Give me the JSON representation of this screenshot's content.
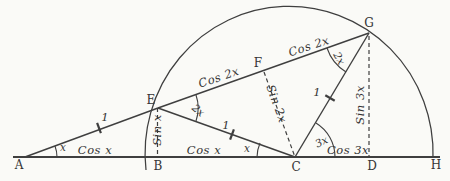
{
  "colors": {
    "ink": "#3f3f3f",
    "paper": "#fafaf7"
  },
  "points": {
    "A": "A",
    "B": "B",
    "C": "C",
    "D": "D",
    "E": "E",
    "F": "F",
    "G": "G",
    "H": "H"
  },
  "base_labels": {
    "ab": "Cos x",
    "bc": "Cos x",
    "cd": "Cos 3x"
  },
  "hyp_labels": {
    "ef": "Cos 2x",
    "fg": "Cos 2x"
  },
  "vert_labels": {
    "eb": "Sin x",
    "fc": "Sin 2x",
    "gd": "Sin 3x"
  },
  "unit_labels": {
    "ae": "1",
    "ec": "1",
    "cg": "1"
  },
  "angle_labels": {
    "a": "x",
    "c_left": "x",
    "e": "2x",
    "g": "2x",
    "c_right": "3x"
  }
}
